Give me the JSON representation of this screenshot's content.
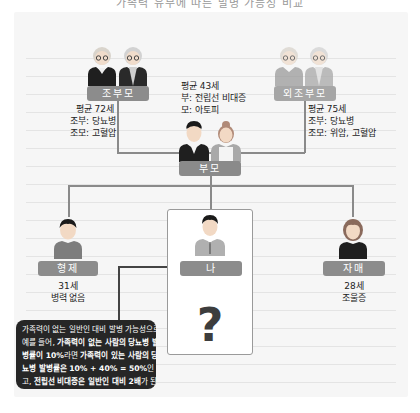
{
  "top_caption": "가족력 유무에 따른 발병 가능성 비교",
  "colors": {
    "panel_bg": "#f6f6f6",
    "label_bar": "#8c8c8c",
    "connector": "#8a8a8a",
    "callout_bg": "#262626",
    "question_mark": "#3d3d3d"
  },
  "family_tree": {
    "paternal_grandparents": {
      "label": "조부모",
      "info": [
        "평균 72세",
        "조부: 당뇨병",
        "조모: 고혈압"
      ],
      "icons": [
        "grandmother-icon",
        "grandfather-icon"
      ]
    },
    "maternal_grandparents": {
      "label": "외조부모",
      "info": [
        "평균 75세",
        "조부: 당뇨병",
        "조모: 위암, 고혈압"
      ],
      "icons": [
        "grandmother-icon",
        "grandfather-icon"
      ]
    },
    "parents": {
      "label": "부모",
      "info": [
        "평균 43세",
        "부: 전립선 비대증",
        "모: 아토피"
      ],
      "icons": [
        "father-icon",
        "mother-icon"
      ]
    },
    "brother": {
      "label": "형제",
      "info": [
        "31세",
        "병력 없음"
      ],
      "icon": "brother-icon"
    },
    "me": {
      "label": "나",
      "question": "?",
      "icon": "me-icon"
    },
    "sister": {
      "label": "자매",
      "info": [
        "28세",
        "조울증"
      ],
      "icon": "sister-icon"
    }
  },
  "callout": {
    "lines": [
      [
        {
          "t": "가족력이 없는 일반인 대비 발병 가능성으로",
          "b": false
        }
      ],
      [
        {
          "t": "예를 들어, ",
          "b": false
        },
        {
          "t": "가족력이 없는 사람의 당뇨병 발",
          "b": true
        }
      ],
      [
        {
          "t": "병률이 10%",
          "b": true
        },
        {
          "t": "라면 ",
          "b": false
        },
        {
          "t": "가족력이 있는 사람의 당",
          "b": true
        }
      ],
      [
        {
          "t": "뇨병 발병률은 10% + 40% = 50%",
          "b": true
        },
        {
          "t": "인 것이",
          "b": false
        }
      ],
      [
        {
          "t": "고, ",
          "b": false
        },
        {
          "t": "전립선 비대증은 일반인 대비 2배",
          "b": true
        },
        {
          "t": "가 된다.",
          "b": false
        }
      ]
    ]
  }
}
